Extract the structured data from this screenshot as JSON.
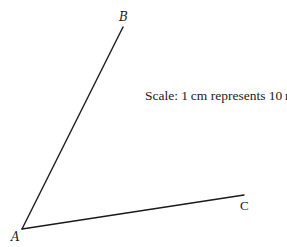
{
  "diagram": {
    "points": {
      "A": {
        "label": "A",
        "x": 22,
        "y": 229
      },
      "B": {
        "label": "B",
        "x": 123,
        "y": 27
      },
      "C": {
        "label": "C",
        "x": 244,
        "y": 195
      }
    },
    "segments": [
      {
        "from": "A",
        "to": "B"
      },
      {
        "from": "A",
        "to": "C"
      }
    ],
    "scale_text": "Scale: 1 cm represents 10 m",
    "line_color": "#1a1a1a"
  }
}
